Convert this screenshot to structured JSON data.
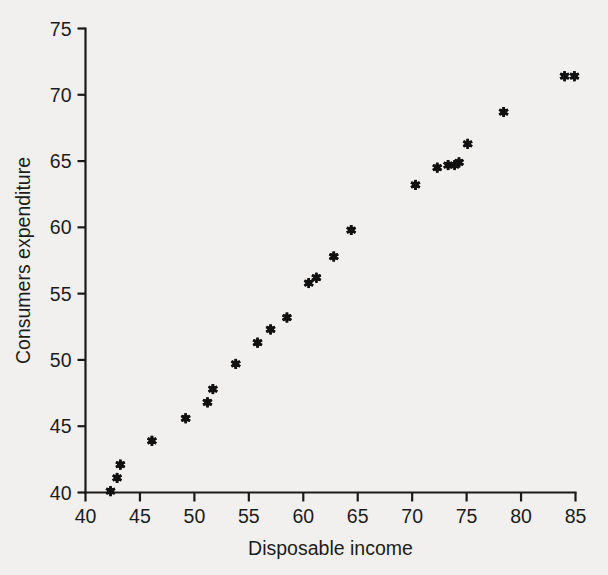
{
  "chart_data": {
    "type": "scatter",
    "title": "",
    "xlabel": "Disposable income",
    "ylabel": "Consumers expenditure",
    "xlim": [
      40,
      85
    ],
    "ylim": [
      40,
      75
    ],
    "xticks": [
      40,
      45,
      50,
      55,
      60,
      65,
      70,
      75,
      80,
      85
    ],
    "yticks": [
      40,
      45,
      50,
      55,
      60,
      65,
      70,
      75
    ],
    "xtick_labels": [
      "40",
      "45",
      "50",
      "55",
      "60",
      "65",
      "70",
      "75",
      "80",
      "85"
    ],
    "ytick_labels": [
      "40",
      "45",
      "50",
      "55",
      "60",
      "65",
      "70",
      "75"
    ],
    "grid": false,
    "legend": null,
    "marker_style": "asterisk",
    "marker_color": "#111111",
    "background_color": "#f1f0ee",
    "axis_color": "#1a1a1a",
    "points": [
      {
        "x": 42.3,
        "y": 40.1
      },
      {
        "x": 42.9,
        "y": 41.1
      },
      {
        "x": 43.2,
        "y": 42.1
      },
      {
        "x": 46.1,
        "y": 43.9
      },
      {
        "x": 49.2,
        "y": 45.6
      },
      {
        "x": 51.2,
        "y": 46.8
      },
      {
        "x": 51.7,
        "y": 47.8
      },
      {
        "x": 53.8,
        "y": 49.7
      },
      {
        "x": 55.8,
        "y": 51.3
      },
      {
        "x": 57.0,
        "y": 52.3
      },
      {
        "x": 58.5,
        "y": 53.2
      },
      {
        "x": 60.5,
        "y": 55.8
      },
      {
        "x": 61.2,
        "y": 56.2
      },
      {
        "x": 62.8,
        "y": 57.8
      },
      {
        "x": 64.4,
        "y": 59.8
      },
      {
        "x": 70.3,
        "y": 63.2
      },
      {
        "x": 72.3,
        "y": 64.5
      },
      {
        "x": 73.3,
        "y": 64.7
      },
      {
        "x": 73.9,
        "y": 64.7
      },
      {
        "x": 74.3,
        "y": 64.9
      },
      {
        "x": 75.1,
        "y": 66.3
      },
      {
        "x": 78.4,
        "y": 68.7
      },
      {
        "x": 84.0,
        "y": 71.4
      },
      {
        "x": 84.9,
        "y": 71.4
      }
    ]
  },
  "figure": {
    "name": "scatter-plot"
  }
}
